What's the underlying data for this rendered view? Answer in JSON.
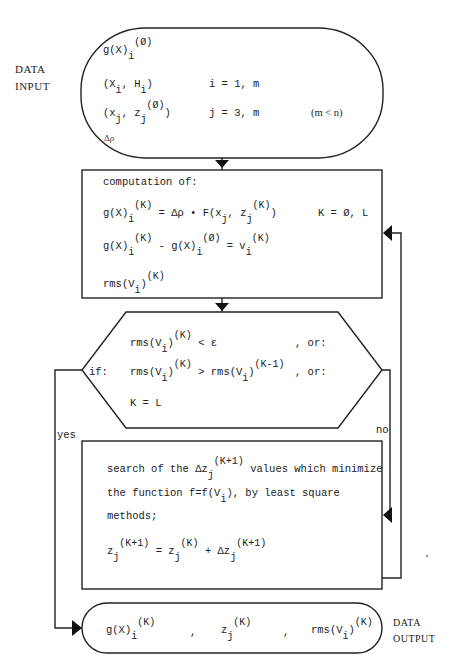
{
  "input_block": {
    "side_label": [
      "DATA",
      "INPUT"
    ],
    "lines": [
      {
        "expr": "g(X)",
        "sub": "i",
        "sup": "(Ø)"
      },
      {
        "expr": "(X , H )",
        "sub_text": "i   i",
        "range": "i = 1, m"
      },
      {
        "expr": "(x , z    )",
        "sub_text": "j   j",
        "sup": "(Ø)",
        "range": "j = 3, m",
        "note": "(m < n)"
      },
      {
        "expr": "Δρ"
      }
    ]
  },
  "computation_block": {
    "title": "computation of:",
    "eq1_left": "g(X)",
    "eq1_sub": "i",
    "eq1_sup": "(K)",
    "eq1_mid": "= Δρ • F(x",
    "eq1_mid_sub": "j",
    "eq1_mid2": ", z",
    "eq1_mid2_sub": "j",
    "eq1_mid2_sup": "(K)",
    "eq1_end": ")",
    "eq1_range": "K = Ø, L",
    "eq2_a": "g(X)",
    "eq2_a_sub": "i",
    "eq2_a_sup": "(K)",
    "eq2_b": "- g(X)",
    "eq2_b_sub": "i",
    "eq2_b_sup": "(Ø)",
    "eq2_c": "= v",
    "eq2_c_sub": "i",
    "eq2_c_sup": "(K)",
    "eq3": "rms(V",
    "eq3_sub": "i",
    "eq3_end": ")",
    "eq3_sup": "(K)"
  },
  "decision_block": {
    "prefix": "if:",
    "c1": "rms(V",
    "c1_sub": "i",
    "c1_end": ")",
    "c1_sup": "(K)",
    "c1_rel": "< ε",
    "c1_tail": ", or:",
    "c2": "rms(V",
    "c2_sub": "i",
    "c2_end": ")",
    "c2_sup": "(K)",
    "c2_rel": "> rms(V",
    "c2_sub2": "i",
    "c2_end2": ")",
    "c2_sup2": "(K-1)",
    "c2_tail": ", or:",
    "c3": "K = L",
    "yes_label": "yes",
    "no_label": "no"
  },
  "search_block": {
    "l1a": "search of the Δz",
    "l1_sub": "j",
    "l1_sup": "(K+1)",
    "l1b": "values which minimize",
    "l2a": "the function f=f(V",
    "l2_sub": "i",
    "l2b": "), by least square",
    "l3": "methods;",
    "eq_a": "z",
    "eq_a_sub": "j",
    "eq_a_sup": "(K+1)",
    "eq_b": "= z",
    "eq_b_sub": "j",
    "eq_b_sup": "(K)",
    "eq_c": "+ Δz",
    "eq_c_sub": "j",
    "eq_c_sup": "(K+1)"
  },
  "output_block": {
    "side_label": [
      "DATA",
      "OUTPUT"
    ],
    "o1": "g(X)",
    "o1_sub": "i",
    "o1_sup": "(K)",
    "sep": ",",
    "o2": "z",
    "o2_sub": "j",
    "o2_sup": "(K)",
    "o3": "rms(V",
    "o3_sub": "i",
    "o3_end": ")",
    "o3_sup": "(K)"
  }
}
